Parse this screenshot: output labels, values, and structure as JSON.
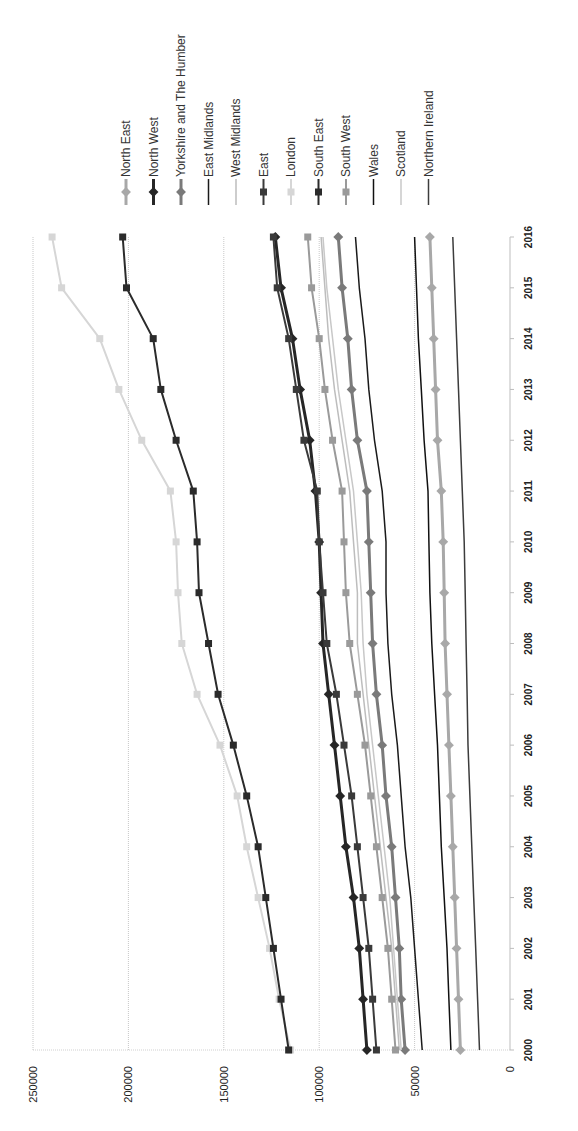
{
  "chart_data": {
    "type": "line",
    "orientation": "rotated-90-clockwise",
    "title": "",
    "xlabel": "",
    "ylabel": "",
    "x": [
      "2000",
      "2001",
      "2002",
      "2003",
      "2004",
      "2005",
      "2006",
      "2007",
      "2008",
      "2009",
      "2010",
      "2011",
      "2012",
      "2013",
      "2014",
      "2015",
      "2016"
    ],
    "ylim": [
      0,
      250000
    ],
    "yticks": [
      "0",
      "50000",
      "100000",
      "150000",
      "200000",
      "250000"
    ],
    "grid": true,
    "legend_position": "right",
    "series": [
      {
        "name": "North East",
        "color": "#a8a8a8",
        "width": 3,
        "marker": "diamond",
        "values": [
          26000,
          27000,
          28000,
          29000,
          30000,
          31000,
          32000,
          33000,
          34000,
          34500,
          35000,
          36000,
          38000,
          39000,
          40000,
          41000,
          42000
        ]
      },
      {
        "name": "North West",
        "color": "#262626",
        "width": 3,
        "marker": "diamond",
        "values": [
          75000,
          77000,
          79000,
          82000,
          86000,
          89000,
          92000,
          95000,
          98000,
          99000,
          100000,
          102000,
          105000,
          110000,
          114000,
          120000,
          123000
        ]
      },
      {
        "name": "Yorkshire and The Humber",
        "color": "#7a7a7a",
        "width": 3,
        "marker": "diamond",
        "values": [
          55000,
          57000,
          58000,
          60000,
          62000,
          65000,
          67000,
          70000,
          72000,
          73000,
          74000,
          75000,
          80000,
          83000,
          85000,
          88000,
          90000
        ]
      },
      {
        "name": "East Midlands",
        "color": "#1a1a1a",
        "width": 1.5,
        "marker": "none",
        "values": [
          46000,
          48000,
          50000,
          52000,
          55000,
          57000,
          59000,
          62000,
          64000,
          65000,
          65000,
          67000,
          71000,
          74000,
          76000,
          79000,
          81000
        ]
      },
      {
        "name": "West Midlands",
        "color": "#bdbdbd",
        "width": 1.5,
        "marker": "none",
        "values": [
          58000,
          60000,
          62000,
          65000,
          68000,
          71000,
          74000,
          77000,
          80000,
          80000,
          82000,
          84000,
          88000,
          92000,
          95000,
          97000,
          99000
        ]
      },
      {
        "name": "East",
        "color": "#3a3a3a",
        "width": 2,
        "marker": "square",
        "values": [
          70000,
          72000,
          74000,
          77000,
          80000,
          83000,
          87000,
          91000,
          96000,
          98000,
          100000,
          101000,
          108000,
          112000,
          116000,
          122000,
          124000
        ]
      },
      {
        "name": "London",
        "color": "#d6d6d6",
        "width": 2,
        "marker": "square",
        "values": [
          115000,
          121000,
          126000,
          132000,
          138000,
          143000,
          152000,
          164000,
          172000,
          174000,
          175000,
          178000,
          193000,
          205000,
          215000,
          235000,
          240000
        ]
      },
      {
        "name": "South East",
        "color": "#2b2b2b",
        "width": 2,
        "marker": "square",
        "values": [
          116000,
          120000,
          124000,
          128000,
          132000,
          138000,
          145000,
          153000,
          158000,
          163000,
          164000,
          166000,
          175000,
          183000,
          187000,
          201000,
          203000
        ]
      },
      {
        "name": "South West",
        "color": "#9a9a9a",
        "width": 2,
        "marker": "square",
        "values": [
          60000,
          62000,
          64000,
          67000,
          70000,
          73000,
          76000,
          80000,
          84000,
          86000,
          87000,
          88000,
          93000,
          97000,
          100000,
          104000,
          106000
        ]
      },
      {
        "name": "Wales",
        "color": "#111111",
        "width": 1.5,
        "marker": "none",
        "values": [
          31000,
          32000,
          33000,
          34500,
          36000,
          37000,
          38000,
          39500,
          41000,
          42000,
          42500,
          43000,
          45000,
          46500,
          48000,
          49000,
          50000
        ]
      },
      {
        "name": "Scotland",
        "color": "#c8c8c8",
        "width": 1.5,
        "marker": "none",
        "values": [
          57000,
          59000,
          61000,
          63000,
          66000,
          69000,
          72000,
          75000,
          77000,
          78000,
          80000,
          82000,
          86000,
          90000,
          93000,
          96000,
          98000
        ]
      },
      {
        "name": "Northern Ireland",
        "color": "#3c3c3c",
        "width": 1.5,
        "marker": "none",
        "values": [
          16000,
          17000,
          18000,
          19000,
          20000,
          21000,
          22000,
          22500,
          23000,
          23500,
          24000,
          25000,
          26000,
          27000,
          28000,
          29000,
          30000
        ]
      }
    ]
  }
}
